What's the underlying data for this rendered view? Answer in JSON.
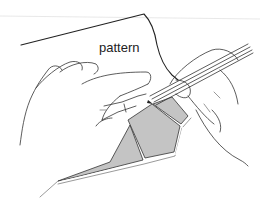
{
  "figure": {
    "labels": {
      "pattern": "pattern"
    },
    "colors": {
      "line": "#333333",
      "fabric_fill": "#c4c4c4",
      "background": "#ffffff"
    }
  }
}
